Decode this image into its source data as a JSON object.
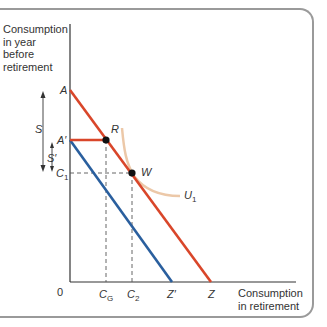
{
  "diagram": {
    "type": "economics-consumption-savings",
    "y_axis_title": [
      "Consumption",
      "in year",
      "before",
      "retirement"
    ],
    "x_axis_title": [
      "Consumption",
      "in retirement"
    ],
    "origin_label": "0",
    "y_labels": {
      "A": "A",
      "A_prime": "A′",
      "C1": "C",
      "C1_sub": "1"
    },
    "x_labels": {
      "CG": "C",
      "CG_sub": "G",
      "C2": "C",
      "C2_sub": "2",
      "Z_prime": "Z′",
      "Z": "Z"
    },
    "points": {
      "R": "R",
      "W": "W"
    },
    "curve_label": "U",
    "curve_label_sub": "1",
    "arrows": {
      "S": "S",
      "S_prime": "S′"
    },
    "colors": {
      "budget_line_original": "#d9462a",
      "budget_line_shifted": "#2a5f9e",
      "indifference_curve": "#ecc8a8",
      "axis": "#333333",
      "frame": "#9a9a9a"
    }
  }
}
